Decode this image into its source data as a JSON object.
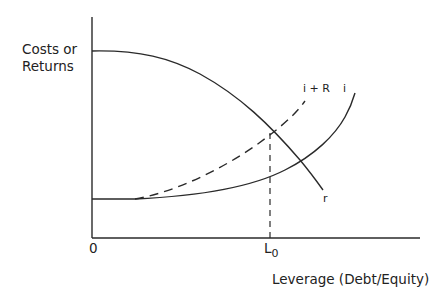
{
  "diagram": {
    "y_axis_label_line1": "Costs or",
    "y_axis_label_line2": "Returns",
    "x_axis_label": "Leverage (Debt/Equity)",
    "origin_label": "0",
    "l0_label": "L",
    "l0_subscript": "0",
    "curves": {
      "r_label": "r",
      "i_label": "i",
      "i_plus_r_label": "i + R"
    },
    "colors": {
      "line": "#2a2a2a",
      "background": "#ffffff"
    }
  }
}
